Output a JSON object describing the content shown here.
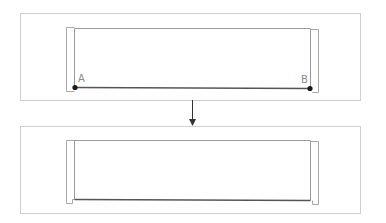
{
  "diagram": {
    "colors": {
      "panel_border": "#cfcfcf",
      "bracket": "#a8a8a8",
      "line": "#555555",
      "point": "#1a1a1a",
      "label": "#8a8a8a",
      "arrow": "#333333"
    },
    "before": {
      "point_a_label": "A",
      "point_b_label": "B"
    },
    "after": {}
  }
}
